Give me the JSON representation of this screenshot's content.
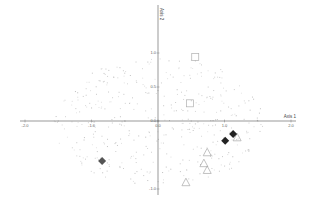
{
  "chart_data": {
    "type": "scatter",
    "title": "",
    "xlabel": "Axis 1",
    "ylabel": "Axis 2",
    "xlim": [
      -2.0,
      2.0
    ],
    "ylim": [
      -1.0,
      1.0
    ],
    "x_ticks": [
      {
        "value": -2.0,
        "label": "-2.0"
      },
      {
        "value": -1.0,
        "label": "-1.0"
      },
      {
        "value": 0.0,
        "label": "0.0"
      },
      {
        "value": 1.0,
        "label": "1.0"
      },
      {
        "value": 2.0,
        "label": "2.0"
      }
    ],
    "y_ticks": [
      {
        "value": 1.0,
        "label": "1.0"
      },
      {
        "value": 0.5,
        "label": "0.5"
      },
      {
        "value": 0.0,
        "label": "0.0"
      },
      {
        "value": -1.0,
        "label": "-1.0"
      }
    ],
    "grid": false,
    "legend": null,
    "series": [
      {
        "name": "squares",
        "marker": "square-open",
        "color": "#b0b0b0",
        "points": [
          [
            0.56,
            0.94
          ],
          [
            0.48,
            0.26
          ]
        ]
      },
      {
        "name": "dark-diamonds",
        "marker": "diamond-filled",
        "color": "#222222",
        "points": [
          [
            1.13,
            -0.19
          ],
          [
            1.01,
            -0.29
          ]
        ]
      },
      {
        "name": "gray-diamond",
        "marker": "diamond-filled",
        "color": "#555555",
        "points": [
          [
            -0.84,
            -0.59
          ]
        ]
      },
      {
        "name": "triangles",
        "marker": "triangle-open",
        "color": "#a8a8a8",
        "points": [
          [
            1.19,
            -0.24
          ],
          [
            0.74,
            -0.46
          ],
          [
            0.69,
            -0.62
          ],
          [
            0.74,
            -0.72
          ],
          [
            0.42,
            -0.9
          ]
        ]
      },
      {
        "name": "background-points",
        "marker": "dot",
        "color": "#d0d0d0",
        "count": 420,
        "extent": {
          "x": [
            -1.6,
            1.6
          ],
          "y": [
            -0.95,
            0.95
          ]
        }
      }
    ]
  },
  "axes": {
    "x_title": "Axis 1",
    "y_title": "Axis 2"
  }
}
